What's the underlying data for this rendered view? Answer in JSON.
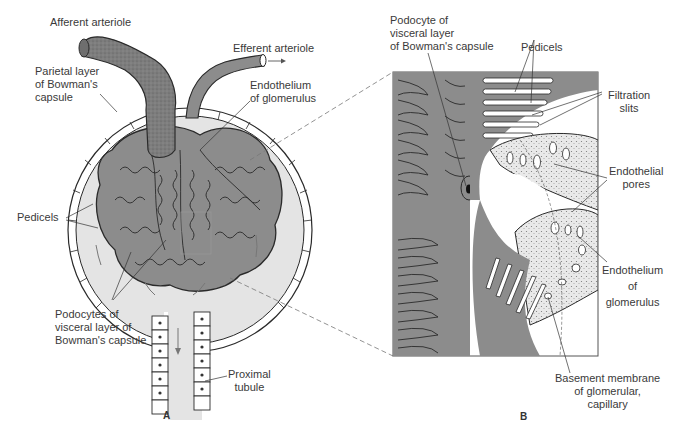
{
  "figure": {
    "panel_a": {
      "letter": "A",
      "labels": {
        "afferent_arteriole": "Afferent arteriole",
        "efferent_arteriole": "Efferent arteriole",
        "parietal_layer_1": "Parietal layer",
        "parietal_layer_2": "of Bowman's",
        "parietal_layer_3": "capsule",
        "endothelium_1": "Endothelium",
        "endothelium_2": "of glomerulus",
        "pedicels": "Pedicels",
        "podocytes_1": "Podocytes of",
        "podocytes_2": "visceral layer  of",
        "podocytes_3": "Bowman's capsule",
        "proximal_1": "Proximal",
        "proximal_2": "tubule"
      }
    },
    "panel_b": {
      "letter": "B",
      "labels": {
        "podocyte_1": "Podocyte of",
        "podocyte_2": "visceral layer",
        "podocyte_3": "of Bowman's capsule",
        "pedicels": "Pedicels",
        "filtration_1": "Filtration",
        "filtration_2": "slits",
        "pores_1": "Endothelial",
        "pores_2": "pores",
        "endothelium_1": "Endothelium",
        "endothelium_2": "of",
        "endothelium_3": "glomerulus",
        "basement_1": "Basement membrane",
        "basement_2": "of glomerular,",
        "basement_3": "capillary"
      }
    },
    "colors": {
      "tissue": "#8c8c8c",
      "tissue_dark": "#6e6e6e",
      "capsule_space": "#e4e4e4",
      "line": "#2a2a2a",
      "text": "#3a3a3a"
    }
  }
}
